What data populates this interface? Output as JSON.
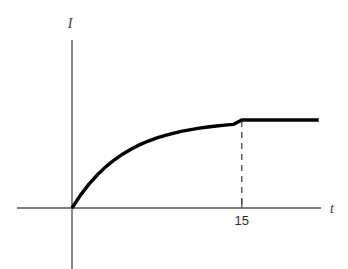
{
  "figure": {
    "name": "current-vs-time-saturation-graph",
    "background_color": "#ffffff",
    "axis_color": "#555555",
    "curve_color": "#000000",
    "dash_color": "#444444",
    "text_color": "#2e2e2e"
  },
  "labels": {
    "y_axis_label": "I",
    "x_axis_label": "t",
    "tick_label_15": "15"
  },
  "chart_data": {
    "type": "line",
    "title": "",
    "xlabel": "t",
    "ylabel": "I",
    "grid": false,
    "legend": null,
    "xlim": [
      0,
      22
    ],
    "ylim": [
      0,
      1.25
    ],
    "annotations": [
      {
        "name": "dashed-dropline",
        "kind": "vertical-dashed-line",
        "x": 15,
        "y_from": 0,
        "y_to": 1.0,
        "style": "dashed"
      },
      {
        "name": "tick-15",
        "kind": "axis-tick",
        "x": 15,
        "label": "15"
      }
    ],
    "tick_values_x": [
      15
    ],
    "tick_labels_x": [
      "15"
    ],
    "tick_values_y": [],
    "tick_labels_y": [],
    "series": [
      {
        "name": "current",
        "description": "Exponential rise to saturation, then constant plateau after t = 15",
        "x": [
          0,
          0.75,
          1.5,
          2.25,
          3,
          3.75,
          4.5,
          5.25,
          6,
          6.75,
          7.5,
          8.25,
          9,
          9.75,
          10.5,
          11.25,
          12,
          12.75,
          13.5,
          14.25,
          15,
          16,
          17,
          18,
          19,
          20,
          21,
          21.8
        ],
        "y": [
          0,
          0.146,
          0.271,
          0.378,
          0.47,
          0.548,
          0.614,
          0.671,
          0.72,
          0.761,
          0.796,
          0.826,
          0.851,
          0.873,
          0.891,
          0.907,
          0.92,
          0.932,
          0.942,
          0.95,
          1.0,
          1.0,
          1.0,
          1.0,
          1.0,
          1.0,
          1.0,
          1.0
        ]
      }
    ]
  }
}
